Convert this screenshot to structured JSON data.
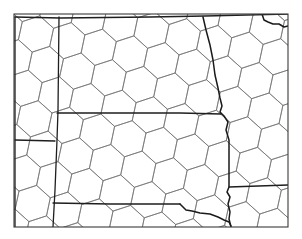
{
  "map": {
    "title": "",
    "width": 302,
    "height": 239,
    "background_color": "#ffffff",
    "frame": {
      "x1": 14,
      "y1": 14,
      "x2": 288,
      "y2": 227,
      "color": "#3a3a3a"
    },
    "hex_grid": {
      "color": "#6e6e6e",
      "radius": 18.5,
      "rotation_deg": 12,
      "origin_x": 36,
      "origin_y": 34
    },
    "borders": [
      {
        "name": "west-frame-inner",
        "points": [
          [
            15,
            17
          ],
          [
            15,
            227
          ]
        ]
      },
      {
        "name": "montana-dakota-border",
        "points": [
          [
            59,
            17
          ],
          [
            58,
            110
          ],
          [
            57,
            140
          ],
          [
            55,
            190
          ],
          [
            53,
            227
          ]
        ]
      },
      {
        "name": "montana-wyoming-border",
        "points": [
          [
            15,
            140
          ],
          [
            55,
            141
          ]
        ]
      },
      {
        "name": "north-south-dakota-border",
        "points": [
          [
            57,
            113
          ],
          [
            120,
            113
          ],
          [
            180,
            113
          ],
          [
            221,
            114
          ]
        ]
      },
      {
        "name": "south-dakota-nebraska-border",
        "points": [
          [
            53,
            203
          ],
          [
            110,
            204
          ],
          [
            180,
            204
          ]
        ]
      },
      {
        "name": "international-border",
        "points": [
          [
            15,
            17
          ],
          [
            60,
            18
          ],
          [
            150,
            17
          ],
          [
            205,
            16
          ],
          [
            288,
            14
          ]
        ]
      },
      {
        "name": "minnesota-iowa-border",
        "points": [
          [
            229,
            187
          ],
          [
            288,
            185
          ]
        ]
      }
    ],
    "rivers": [
      {
        "name": "red-river",
        "points": [
          [
            203,
            17
          ],
          [
            206,
            30
          ],
          [
            210,
            45
          ],
          [
            213,
            60
          ],
          [
            215,
            75
          ],
          [
            218,
            88
          ],
          [
            220,
            98
          ],
          [
            222,
            106
          ],
          [
            220,
            112
          ],
          [
            224,
            116
          ],
          [
            228,
            122
          ],
          [
            226,
            130
          ],
          [
            229,
            140
          ],
          [
            229,
            160
          ],
          [
            229,
            175
          ],
          [
            229,
            187
          ],
          [
            227,
            192
          ],
          [
            230,
            197
          ],
          [
            228,
            204
          ],
          [
            230,
            212
          ],
          [
            229,
            219
          ],
          [
            231,
            227
          ]
        ]
      },
      {
        "name": "missouri-river",
        "points": [
          [
            180,
            204
          ],
          [
            186,
            210
          ],
          [
            192,
            211
          ],
          [
            200,
            213
          ],
          [
            210,
            214
          ],
          [
            218,
            217
          ],
          [
            224,
            220
          ],
          [
            229,
            222
          ],
          [
            231,
            226
          ]
        ]
      },
      {
        "name": "lake-of-the-woods-shore",
        "points": [
          [
            262,
            14
          ],
          [
            264,
            20
          ],
          [
            268,
            22
          ],
          [
            273,
            24
          ],
          [
            279,
            24
          ],
          [
            284,
            27
          ],
          [
            288,
            26
          ]
        ]
      }
    ],
    "labels": []
  }
}
